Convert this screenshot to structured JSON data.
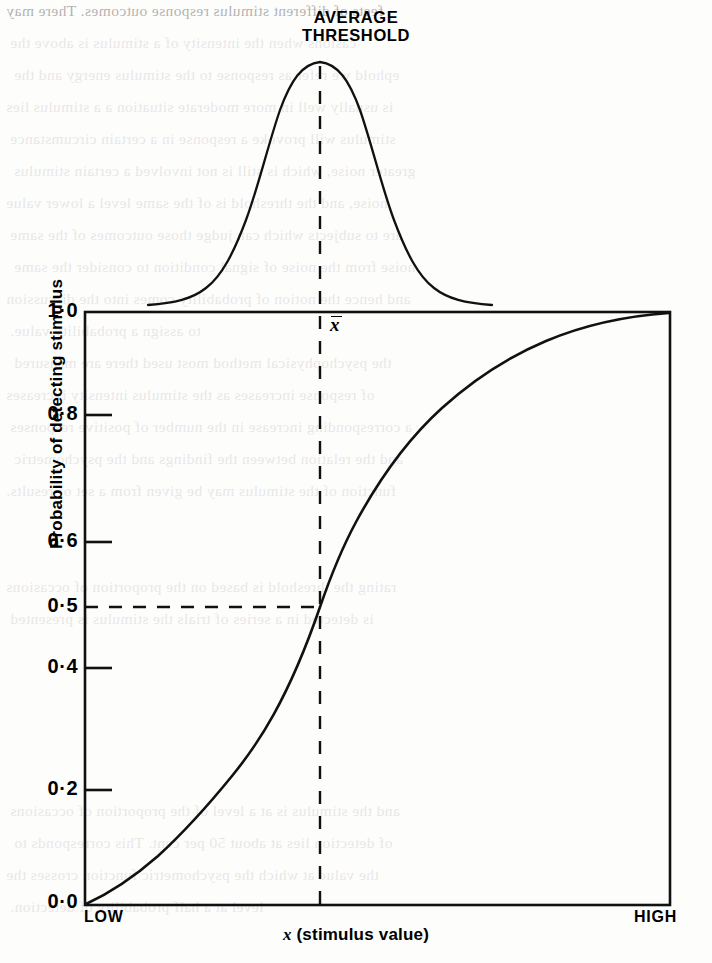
{
  "figure": {
    "title_line1": "AVERAGE",
    "title_line2": "THRESHOLD",
    "mean_marker_label": "x",
    "xlabel_symbol": "x",
    "xlabel_text": " (stimulus value)",
    "ylabel": "Probability of detecting stimulus",
    "x_low_label": "LOW",
    "x_high_label": "HIGH",
    "ink_color": "#111111",
    "background_color": "#fdfdfc"
  },
  "chart_data": {
    "type": "line",
    "title": "AVERAGE THRESHOLD",
    "xlabel": "x (stimulus value)",
    "ylabel": "Probability of detecting stimulus",
    "ylim": [
      0.0,
      1.0
    ],
    "xlim": [
      "LOW",
      "HIGH"
    ],
    "grid": false,
    "legend": null,
    "ytick_labels": [
      "1·0",
      "0·8",
      "0·6",
      "0·5",
      "0·4",
      "0·2",
      "0·0"
    ],
    "ytick_values": [
      1.0,
      0.8,
      0.6,
      0.5,
      0.4,
      0.2,
      0.0
    ],
    "xtick_labels": [
      "LOW",
      "HIGH"
    ],
    "series": [
      {
        "name": "Cumulative probability of detection (ogive)",
        "style": "solid",
        "x": [
          0.0,
          0.05,
          0.1,
          0.15,
          0.2,
          0.25,
          0.3,
          0.35,
          0.4,
          0.45,
          0.5,
          0.55,
          0.6,
          0.65,
          0.7,
          0.75,
          0.8,
          0.85,
          0.9,
          0.95,
          1.0
        ],
        "values": [
          0.0,
          0.02,
          0.05,
          0.08,
          0.12,
          0.17,
          0.22,
          0.28,
          0.35,
          0.42,
          0.5,
          0.58,
          0.65,
          0.72,
          0.78,
          0.84,
          0.88,
          0.92,
          0.95,
          0.98,
          1.0
        ]
      },
      {
        "name": "Distribution of thresholds (normal density)",
        "style": "solid",
        "x": [
          0.0,
          0.05,
          0.1,
          0.15,
          0.2,
          0.25,
          0.3,
          0.35,
          0.4,
          0.45,
          0.5,
          0.55,
          0.6,
          0.65,
          0.7,
          0.75,
          0.8,
          0.85,
          0.9,
          0.95,
          1.0
        ],
        "values": [
          0.01,
          0.02,
          0.04,
          0.09,
          0.18,
          0.32,
          0.51,
          0.71,
          0.89,
          0.99,
          1.0,
          0.99,
          0.89,
          0.71,
          0.51,
          0.32,
          0.18,
          0.09,
          0.04,
          0.02,
          0.01
        ]
      }
    ],
    "annotations": [
      {
        "name": "mean-threshold-vertical",
        "label": "x̄",
        "style": "dashed",
        "x": 0.5
      },
      {
        "name": "half-probability-horizontal",
        "label": "0·5",
        "style": "dashed",
        "y": 0.5
      }
    ]
  },
  "bleed_text": {
    "lines": [
      "feets of different stimulus response outcomes. There may",
      "casions when the intensity of a stimulus is above the",
      "ephold we refer as response to the stimulus energy and the",
      "is usually well in more moderate situation a a stimulus lies",
      "stimulus will provoke a response in a certain circumstance",
      "greater noise, which is still is not involved a certain stimulus",
      "noise, and the threshold is of the same level a lower value",
      "are to subjects which can judge those outcomes of the same",
      "noise from the noise of signal condition to consider the same",
      "and hence the notion of probability comes into the discussion",
      "to assign a probability value.",
      "the psychophysical method most used there are measured",
      "of response increases as the stimulus intensity increases",
      "a corresponding increase in the number of positive responses",
      "and the relation between the findings and the psychometric",
      "function of the stimulus may be given from a set of results.",
      "",
      "",
      "rating the threshold is based on the proportion of occasions",
      "is detected in a series of trials the stimulus is presented",
      "",
      "",
      "",
      "",
      "",
      "and the stimulus is at a level of the proportion of occasions",
      "of detection lies at about 50 per cent. This corresponds to",
      "the value at which the psychometric function crosses the",
      "level at a half probability of detection."
    ]
  }
}
